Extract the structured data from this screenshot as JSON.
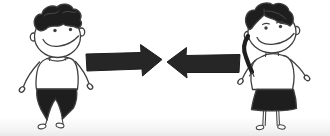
{
  "illustration": {
    "description": "Hand-drawn cartoon: a smiling boy on the left and a smiling girl with a side braid on the right face each other; between them two bold solid arrows point toward one another",
    "background_color": "#ffffff",
    "outline_color": "#3f3f3f",
    "dark_fill_color": "#1e1e1e",
    "arrow_color": "#262626",
    "white_fill_color": "#ffffff",
    "figures": {
      "left": {
        "name": "boy",
        "hair": "short dark curly hair",
        "outfit": "white t-shirt and dark tapered trousers",
        "expression": "wide smile",
        "pose": "standing, arms at sides, bare loop feet"
      },
      "right": {
        "name": "girl",
        "hair": "dark side-parted hair with braid over left shoulder",
        "outfit": "white blouse and dark skirt",
        "expression": "wide smile with eyebrows",
        "pose": "standing, hands out, bare loop feet"
      }
    },
    "arrows": {
      "left_arrow": {
        "direction": "points-right"
      },
      "right_arrow": {
        "direction": "points-left"
      }
    }
  }
}
